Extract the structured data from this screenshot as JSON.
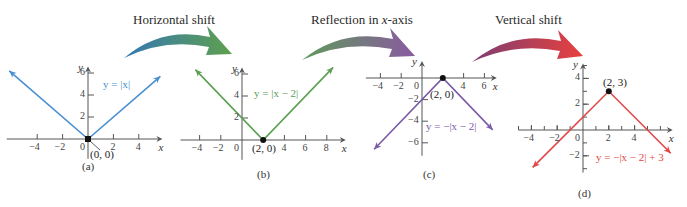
{
  "steps": [
    {
      "label_pre": "Horizontal shift",
      "label_italic": "",
      "label_post": "",
      "x": 133,
      "y": 12,
      "arrow": {
        "from": [
          124,
          58
        ],
        "to": [
          232,
          54
        ],
        "color_start": "#3478b4",
        "color_end": "#5fa04e"
      }
    },
    {
      "label_pre": "Reflection in ",
      "label_italic": "x",
      "label_post": "-axis",
      "x": 311,
      "y": 12,
      "arrow": {
        "from": [
          302,
          60
        ],
        "to": [
          415,
          56
        ],
        "color_start": "#5e9a5a",
        "color_end": "#8a5aa0"
      }
    },
    {
      "label_pre": "Vertical shift",
      "label_italic": "",
      "label_post": "",
      "x": 495,
      "y": 12,
      "arrow": {
        "from": [
          472,
          62
        ],
        "to": [
          583,
          56
        ],
        "color_start": "#7c3e72",
        "color_end": "#e8403e"
      }
    }
  ],
  "chart_data": [
    {
      "type": "line",
      "panel": "(a)",
      "title": "",
      "equation": "y = |x|",
      "function": "abs",
      "h": 0,
      "k": 0,
      "a": 1,
      "color": "#4a90d0",
      "origin_px": [
        88,
        139
      ],
      "sx": 12.7,
      "sy": 11,
      "xlim": [
        -6.4,
        5.7
      ],
      "ylim": [
        -1.8,
        6.4
      ],
      "line_x_range": [
        -6.2,
        5.7
      ],
      "xticks": [
        -4,
        -2,
        0,
        2,
        4
      ],
      "yticks": [
        2,
        4,
        6
      ],
      "xtick_labels": [
        "−4",
        "−2",
        "0",
        "2",
        "4"
      ],
      "ytick_labels": [
        "2",
        "4",
        "6"
      ],
      "minor_ticks": false,
      "xlabel": "x",
      "ylabel": "y",
      "point": {
        "x": 0,
        "y": 0,
        "label": "(0, 0)",
        "style": "square"
      },
      "equation_pos": [
        103,
        78
      ],
      "point_label_pos": [
        90,
        148
      ],
      "caption": "(a)",
      "caption_pos": [
        82,
        160
      ]
    },
    {
      "type": "line",
      "panel": "(b)",
      "title": "",
      "equation": "y = |x − 2|",
      "function": "abs",
      "h": 2,
      "k": 0,
      "a": 1,
      "color": "#5aa050",
      "origin_px": [
        242,
        140
      ],
      "sx": 10.6,
      "sy": 11,
      "xlim": [
        -5.8,
        9.6
      ],
      "ylim": [
        -1.8,
        6.4
      ],
      "line_x_range": [
        -4.4,
        8.6
      ],
      "xticks": [
        -4,
        -2,
        0,
        4,
        6,
        8
      ],
      "yticks": [
        2,
        4,
        6
      ],
      "xtick_labels": [
        "−4",
        "−2",
        "0",
        "4",
        "6",
        "8"
      ],
      "ytick_labels": [
        "2",
        "4",
        "6"
      ],
      "minor_ticks": false,
      "xlabel": "x",
      "ylabel": "y",
      "point": {
        "x": 2,
        "y": 0,
        "label": "(2, 0)",
        "style": "dot"
      },
      "equation_pos": [
        254,
        87
      ],
      "point_label_pos": [
        252,
        142
      ],
      "caption": "(b)",
      "caption_pos": [
        257,
        168
      ]
    },
    {
      "type": "line",
      "panel": "(c)",
      "title": "",
      "equation": "y = −|x − 2|",
      "function": "abs",
      "h": 2,
      "k": 0,
      "a": -1,
      "color": "#7a5aa8",
      "origin_px": [
        422,
        78
      ],
      "sx": 10.4,
      "sy": 10.8,
      "xlim": [
        -5.4,
        7.0
      ],
      "ylim": [
        -7.2,
        1.4
      ],
      "line_x_range": [
        -4.6,
        6.8
      ],
      "xticks": [
        -4,
        -2,
        0,
        4,
        6
      ],
      "yticks": [
        -2,
        -4,
        -6
      ],
      "xtick_labels": [
        "−4",
        "−2",
        "0",
        "4",
        "6"
      ],
      "ytick_labels": [
        "−2",
        "−4",
        "−6"
      ],
      "minor_ticks": false,
      "xlabel": "x",
      "ylabel": "y",
      "point": {
        "x": 2,
        "y": 0,
        "label": "(2, 0)",
        "style": "dot"
      },
      "equation_pos": [
        426,
        120
      ],
      "point_label_pos": [
        430,
        88
      ],
      "caption": "(c)",
      "caption_pos": [
        423,
        168
      ]
    },
    {
      "type": "line",
      "panel": "(d)",
      "title": "",
      "equation": "y = −|x − 2| + 3",
      "function": "abs",
      "h": 2,
      "k": 3,
      "a": -1,
      "color": "#e04848",
      "origin_px": [
        583,
        130
      ],
      "sx": 12.9,
      "sy": 12.9,
      "xlim": [
        -5.0,
        6.8
      ],
      "ylim": [
        -3.3,
        5.0
      ],
      "line_x_range": [
        -3.9,
        6.8
      ],
      "xticks": [
        -4,
        -2,
        0,
        2,
        4
      ],
      "yticks": [
        4,
        2,
        -2
      ],
      "xtick_labels": [
        "−4",
        "−2",
        "0",
        "2",
        "4"
      ],
      "ytick_labels": [
        "4",
        "2",
        "−2"
      ],
      "minor_ticks": true,
      "xlabel": "x",
      "ylabel": "y",
      "point": {
        "x": 2,
        "y": 3,
        "label": "(2, 3)",
        "style": "dot"
      },
      "equation_pos": [
        596,
        151
      ],
      "point_label_pos": [
        603,
        76
      ],
      "caption": "(d)",
      "caption_pos": [
        578,
        187
      ]
    }
  ]
}
